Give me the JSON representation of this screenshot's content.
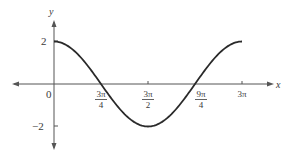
{
  "chart_data": {
    "type": "line",
    "title": "",
    "xlabel": "x",
    "ylabel": "y",
    "function": "y = 2cos(2x/3)",
    "xlim": [
      0,
      9.42478
    ],
    "ylim": [
      -2,
      2
    ],
    "grid": false,
    "legend": null,
    "x_ticks": [
      {
        "value": 0,
        "label": "0"
      },
      {
        "value": 2.35619,
        "label_num": "3π",
        "label_den": "4"
      },
      {
        "value": 4.71239,
        "label_num": "3π",
        "label_den": "2"
      },
      {
        "value": 7.06858,
        "label_num": "9π",
        "label_den": "4"
      },
      {
        "value": 9.42478,
        "label": "3π"
      }
    ],
    "y_ticks": [
      {
        "value": 2,
        "label": "2"
      },
      {
        "value": -2,
        "label": "−2"
      }
    ],
    "series": [
      {
        "name": "y = 2cos(2x/3)",
        "x": [
          0,
          0.7854,
          1.5708,
          2.35619,
          3.14159,
          3.92699,
          4.71239,
          5.49779,
          6.28319,
          7.06858,
          7.85398,
          8.63938,
          9.42478
        ],
        "y": [
          2,
          1.732,
          1.0,
          0,
          -1.0,
          -1.732,
          -2,
          -1.732,
          -1.0,
          0,
          1.0,
          1.732,
          2
        ]
      }
    ],
    "colors": {
      "curve": "#2a2a2a",
      "axes": "#555555",
      "text": "#3a3a3a"
    }
  },
  "labels": {
    "x_axis": "x",
    "y_axis": "y",
    "origin": "0",
    "y_pos": "2",
    "y_neg": "−2",
    "t1_num": "3π",
    "t1_den": "4",
    "t2_num": "3π",
    "t2_den": "2",
    "t3_num": "9π",
    "t3_den": "4",
    "t4": "3π"
  }
}
